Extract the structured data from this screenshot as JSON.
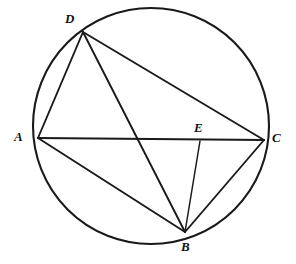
{
  "figure": {
    "kind": "circle-geometry-diagram",
    "width": 296,
    "height": 264,
    "background_color": "#ffffff",
    "stroke_color": "#1a1a1a",
    "label_color": "#111111",
    "circle_stroke_width": 2.1,
    "chord_stroke_width": 1.9,
    "segment_stroke_width": 1.5
  },
  "circle": {
    "name": "circumscribed-circle",
    "cx": 151,
    "cy": 126,
    "r": 118
  },
  "points": [
    {
      "id": "A",
      "label": "A",
      "x": 38,
      "y": 138,
      "on_circle": true,
      "label_x": 14,
      "label_y": 130
    },
    {
      "id": "B",
      "label": "B",
      "x": 185,
      "y": 232,
      "on_circle": true,
      "label_x": 181,
      "label_y": 240
    },
    {
      "id": "C",
      "label": "C",
      "x": 264,
      "y": 140,
      "on_circle": true,
      "label_x": 272,
      "label_y": 131
    },
    {
      "id": "D",
      "label": "D",
      "x": 83,
      "y": 32,
      "on_circle": true,
      "label_x": 65,
      "label_y": 12
    },
    {
      "id": "E",
      "label": "E",
      "x": 200,
      "y": 141,
      "on_circle": false,
      "label_x": 194,
      "label_y": 121
    }
  ],
  "chords": [
    {
      "name": "chord-AD",
      "from": "A",
      "to": "D",
      "x1": 38,
      "y1": 138,
      "x2": 83,
      "y2": 32
    },
    {
      "name": "chord-AC",
      "from": "A",
      "to": "C",
      "x1": 38,
      "y1": 138,
      "x2": 264,
      "y2": 140
    },
    {
      "name": "chord-AB",
      "from": "A",
      "to": "B",
      "x1": 38,
      "y1": 138,
      "x2": 185,
      "y2": 232
    },
    {
      "name": "chord-DC",
      "from": "D",
      "to": "C",
      "x1": 83,
      "y1": 32,
      "x2": 264,
      "y2": 140
    },
    {
      "name": "chord-DB",
      "from": "D",
      "to": "B",
      "x1": 83,
      "y1": 32,
      "x2": 185,
      "y2": 232
    },
    {
      "name": "chord-BC",
      "from": "B",
      "to": "C",
      "x1": 185,
      "y1": 232,
      "x2": 264,
      "y2": 140
    }
  ],
  "segments": [
    {
      "name": "segment-BE",
      "from": "B",
      "to": "E",
      "x1": 185,
      "y1": 232,
      "x2": 200,
      "y2": 141
    }
  ]
}
